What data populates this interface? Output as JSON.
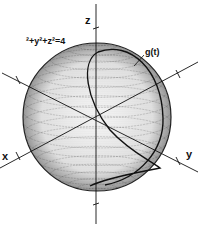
{
  "figure": {
    "equation_label": "²+y²+z²=4",
    "curve_label": "g(t)",
    "axes": {
      "x_label": "x",
      "y_label": "y",
      "z_label": "z"
    },
    "sphere": {
      "equation": "x²+y²+z²=4",
      "radius": 2,
      "style": "stippled"
    },
    "colors": {
      "ink": "#111111",
      "background": "#ffffff"
    }
  }
}
